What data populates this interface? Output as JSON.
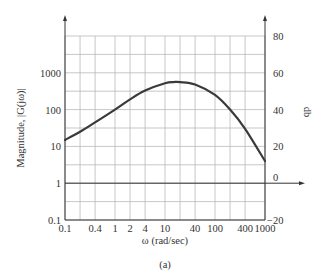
{
  "chart_data": {
    "type": "line",
    "title": "",
    "caption": "(a)",
    "xlabel": "ω (rad/sec)",
    "ylabel": "Magnitude, |G(jω)|",
    "y2label": "db",
    "xscale": "log",
    "yscale": "log",
    "xlim": [
      0.1,
      1000
    ],
    "ylim": [
      0.1,
      10000
    ],
    "y2lim": [
      -20,
      80
    ],
    "grid": true,
    "x_ticks": [
      "0.1",
      "0.4",
      "1",
      "2",
      "4",
      "10",
      "40",
      "100",
      "400",
      "1000"
    ],
    "x_tick_values": [
      0.1,
      0.4,
      1,
      2,
      4,
      10,
      40,
      100,
      400,
      1000
    ],
    "y_ticks": [
      "0.1",
      "1",
      "10",
      "100",
      "1000"
    ],
    "y_tick_values": [
      0.1,
      1,
      10,
      100,
      1000
    ],
    "y2_ticks": [
      "−20",
      "0",
      "20",
      "40",
      "60",
      "80"
    ],
    "y2_tick_values": [
      -20,
      0,
      20,
      40,
      60,
      80
    ],
    "series": [
      {
        "name": "|G(jω)|",
        "x": [
          0.1,
          0.2,
          0.4,
          1,
          2,
          4,
          10,
          15,
          20,
          40,
          100,
          200,
          400,
          1000
        ],
        "values": [
          15,
          25,
          45,
          100,
          190,
          330,
          520,
          560,
          560,
          480,
          250,
          100,
          30,
          4
        ]
      }
    ]
  },
  "labels": {
    "ylabel": "Magnitude, |G(jω)|",
    "y2label": "db",
    "xlabel": "ω (rad/sec)",
    "caption": "(a)"
  }
}
